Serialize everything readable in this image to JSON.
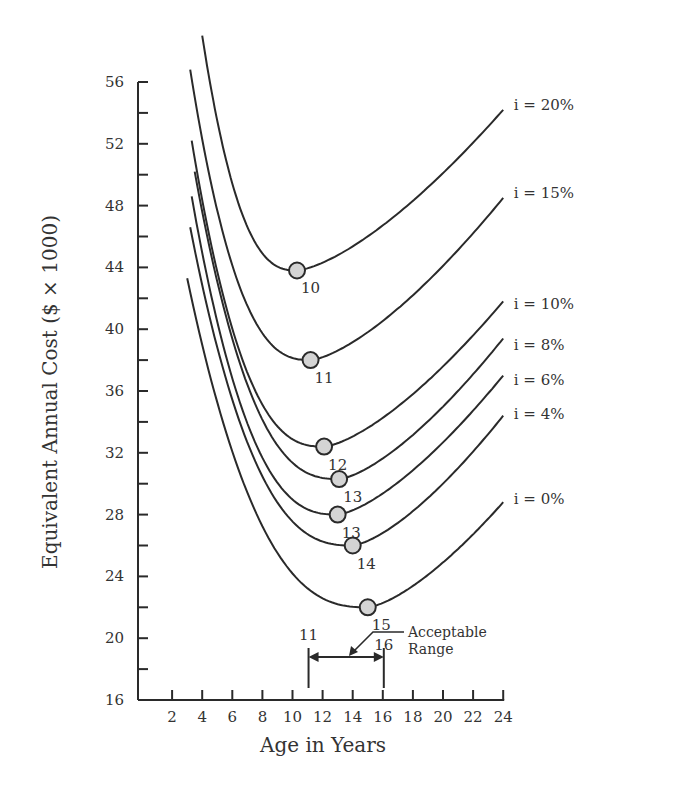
{
  "chart_data": {
    "type": "line",
    "title": "",
    "xlabel": "Age in Years",
    "ylabel": "Equivalent Annual Cost ($ × 1000)",
    "xlim": [
      0,
      24
    ],
    "ylim": [
      16,
      56
    ],
    "x_ticks": [
      2,
      4,
      6,
      8,
      10,
      12,
      14,
      16,
      18,
      20,
      22,
      24
    ],
    "y_ticks": [
      16,
      20,
      24,
      28,
      32,
      36,
      40,
      44,
      48,
      52,
      56
    ],
    "y_minor_ticks": [
      18,
      22,
      26,
      30,
      34,
      38,
      42,
      46,
      50,
      54
    ],
    "grid": false,
    "legend": "inline labels at right end of each curve",
    "series": [
      {
        "name": "i = 20%",
        "start": [
          4.0,
          59.0
        ],
        "min": [
          10.3,
          43.8
        ],
        "min_label": "10",
        "end": [
          24,
          54.2
        ],
        "label_pos": [
          24.7,
          54.5
        ]
      },
      {
        "name": "i = 15%",
        "start": [
          3.2,
          56.8
        ],
        "min": [
          11.2,
          38.0
        ],
        "min_label": "11",
        "end": [
          24,
          48.5
        ],
        "label_pos": [
          24.7,
          48.8
        ]
      },
      {
        "name": "i = 10%",
        "start": [
          3.3,
          52.2
        ],
        "min": [
          12.1,
          32.4
        ],
        "min_label": "12",
        "end": [
          24,
          41.8
        ],
        "label_pos": [
          24.7,
          41.6
        ]
      },
      {
        "name": "i = 8%",
        "start": [
          3.5,
          50.2
        ],
        "min": [
          13.1,
          30.3
        ],
        "min_label": "13",
        "end": [
          24,
          39.4
        ],
        "label_pos": [
          24.7,
          39.0
        ]
      },
      {
        "name": "i = 6%",
        "start": [
          3.3,
          48.6
        ],
        "min": [
          13.0,
          28.0
        ],
        "min_label": "13",
        "end": [
          24,
          37.0
        ],
        "label_pos": [
          24.7,
          36.7
        ]
      },
      {
        "name": "i = 4%",
        "start": [
          3.2,
          46.6
        ],
        "min": [
          14.0,
          26.0
        ],
        "min_label": "14",
        "end": [
          24,
          34.4
        ],
        "label_pos": [
          24.7,
          34.5
        ]
      },
      {
        "name": "i = 0%",
        "start": [
          3.0,
          43.3
        ],
        "min": [
          15.0,
          22.0
        ],
        "min_label": "15",
        "end": [
          24,
          28.8
        ],
        "label_pos": [
          24.7,
          29.0
        ]
      }
    ],
    "annotations": {
      "acceptable_range": {
        "label_line1": "Acceptable",
        "label_line2": "Range",
        "from": 11,
        "to": 16,
        "from_label": "11",
        "to_label": "16"
      }
    }
  },
  "colors": {
    "line": "#2a2a2a",
    "marker_fill": "#d4d4d4",
    "marker_stroke": "#2a2a2a",
    "background": "#ffffff"
  }
}
